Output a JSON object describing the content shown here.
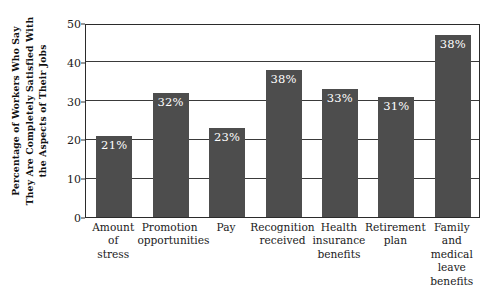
{
  "chart_data": {
    "type": "bar",
    "title": "",
    "subtitle": "",
    "xlabel": "",
    "ylabel": "Percentage of Workers Who Say They Are Completely Satisfied With the Aspects of Their Jobs",
    "ylabel_lines": [
      "Percentage of Workers Who Say",
      "They Are Completely Satisfied With",
      "the Aspects of Their Jobs"
    ],
    "categories": [
      "Amount of stress",
      "Promotion opportunities",
      "Pay",
      "Recognition received",
      "Health insurance benefits",
      "Retirement plan",
      "Family and medical leave benefits"
    ],
    "category_lines": [
      [
        "Amount",
        "of",
        "stress"
      ],
      [
        "Promotion",
        "opportunities"
      ],
      [
        "Pay"
      ],
      [
        "Recognition",
        "received"
      ],
      [
        "Health",
        "insurance",
        "benefits"
      ],
      [
        "Retirement",
        "plan"
      ],
      [
        "Family",
        "and",
        "medical",
        "leave",
        "benefits"
      ]
    ],
    "values": [
      21,
      32,
      23,
      38,
      33,
      31,
      47
    ],
    "data_labels": [
      "21%",
      "32%",
      "23%",
      "38%",
      "33%",
      "31%",
      "38%"
    ],
    "ylim": [
      0,
      50
    ],
    "yticks": [
      0,
      10,
      20,
      30,
      40,
      50
    ],
    "ytick_labels": [
      "0",
      "10",
      "20",
      "30",
      "40",
      "50"
    ],
    "grid": true,
    "grid_axis": "y",
    "legend": false,
    "legend_position": "none",
    "bar_color": "#4d4d4d",
    "label_color": "#ffffff",
    "axis_color": "#2b2b2b",
    "background_color": "#ffffff"
  }
}
